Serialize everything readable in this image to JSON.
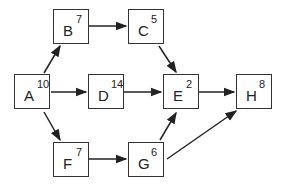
{
  "diagram": {
    "type": "activity-network",
    "nodes": [
      {
        "id": "A",
        "duration": "10",
        "x": 14,
        "y": 74
      },
      {
        "id": "B",
        "duration": "7",
        "x": 53,
        "y": 9
      },
      {
        "id": "C",
        "duration": "5",
        "x": 128,
        "y": 9
      },
      {
        "id": "D",
        "duration": "14",
        "x": 88,
        "y": 74
      },
      {
        "id": "E",
        "duration": "2",
        "x": 163,
        "y": 74
      },
      {
        "id": "F",
        "duration": "7",
        "x": 53,
        "y": 142
      },
      {
        "id": "G",
        "duration": "6",
        "x": 128,
        "y": 142
      },
      {
        "id": "H",
        "duration": "8",
        "x": 236,
        "y": 74
      }
    ],
    "edges": [
      {
        "from": "A",
        "to": "B"
      },
      {
        "from": "A",
        "to": "D"
      },
      {
        "from": "A",
        "to": "F"
      },
      {
        "from": "B",
        "to": "C"
      },
      {
        "from": "C",
        "to": "E"
      },
      {
        "from": "D",
        "to": "E"
      },
      {
        "from": "F",
        "to": "G"
      },
      {
        "from": "G",
        "to": "E"
      },
      {
        "from": "G",
        "to": "H"
      },
      {
        "from": "E",
        "to": "H"
      }
    ]
  }
}
